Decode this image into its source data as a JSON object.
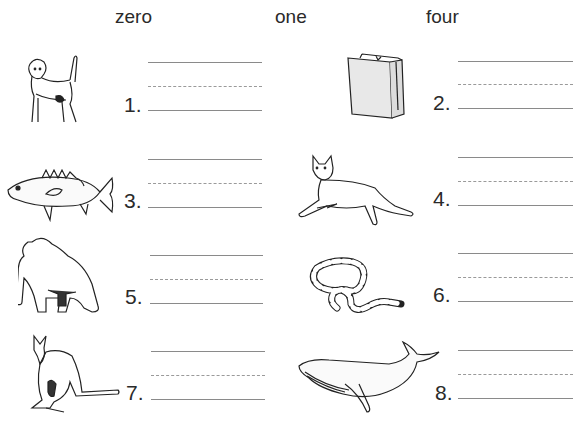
{
  "header": {
    "words": [
      "zero",
      "one",
      "four"
    ]
  },
  "items": [
    {
      "number": "1.",
      "picture": "dog"
    },
    {
      "number": "2.",
      "picture": "paper-bag"
    },
    {
      "number": "3.",
      "picture": "fish"
    },
    {
      "number": "4.",
      "picture": "cat"
    },
    {
      "number": "5.",
      "picture": "gorilla"
    },
    {
      "number": "6.",
      "picture": "snake"
    },
    {
      "number": "7.",
      "picture": "kangaroo"
    },
    {
      "number": "8.",
      "picture": "whale"
    }
  ]
}
